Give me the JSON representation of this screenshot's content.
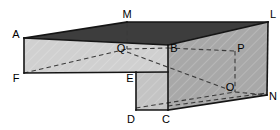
{
  "figure": {
    "name": "3d-solid-diagram",
    "width": 280,
    "height": 130,
    "background_color": "#ffffff"
  },
  "colors": {
    "top_face": "#3d3d3d",
    "left_front_face": "#d0d0d0",
    "right_front_face": "#a8a8a8",
    "step_front_face": "#c4c4c4",
    "step_side_face": "#b4b4b4",
    "outline": "#1a1a1a",
    "hidden_edge": "#444444",
    "label_text": "#000000"
  },
  "labels": [
    {
      "id": "A",
      "text": "A",
      "x": 16,
      "y": 34
    },
    {
      "id": "M",
      "text": "M",
      "x": 127,
      "y": 14
    },
    {
      "id": "L",
      "text": "L",
      "x": 273,
      "y": 14
    },
    {
      "id": "Q",
      "text": "Q",
      "x": 121,
      "y": 48
    },
    {
      "id": "B",
      "text": "B",
      "x": 174,
      "y": 48
    },
    {
      "id": "P",
      "text": "P",
      "x": 241,
      "y": 48
    },
    {
      "id": "F",
      "text": "F",
      "x": 16,
      "y": 78
    },
    {
      "id": "E",
      "text": "E",
      "x": 130,
      "y": 78
    },
    {
      "id": "O",
      "text": "O",
      "x": 230,
      "y": 87
    },
    {
      "id": "N",
      "text": "N",
      "x": 273,
      "y": 96
    },
    {
      "id": "D",
      "text": "D",
      "x": 131,
      "y": 119
    },
    {
      "id": "C",
      "text": "C",
      "x": 166,
      "y": 119
    }
  ],
  "vertices": {
    "A": {
      "x": 24,
      "y": 38
    },
    "M": {
      "x": 127,
      "y": 22
    },
    "L": {
      "x": 268,
      "y": 22
    },
    "B": {
      "x": 168,
      "y": 45
    },
    "Q": {
      "x": 127,
      "y": 49
    },
    "P": {
      "x": 235,
      "y": 51
    },
    "F": {
      "x": 24,
      "y": 73
    },
    "E": {
      "x": 136,
      "y": 72
    },
    "O": {
      "x": 235,
      "y": 92
    },
    "N": {
      "x": 267,
      "y": 95
    },
    "D": {
      "x": 136,
      "y": 110
    },
    "C": {
      "x": 168,
      "y": 110
    }
  },
  "faces": [
    {
      "name": "top-face",
      "vertices": "A,M,L,B",
      "fill": "#3d3d3d"
    },
    {
      "name": "left-front-face",
      "vertices": "A,B,E,F",
      "fill": "#d0d0d0"
    },
    {
      "name": "right-front-face",
      "vertices": "B,L,N,C",
      "fill": "#a8a8a8"
    },
    {
      "name": "step-front-face",
      "vertices": "E,C,D",
      "fill": "#c4c4c4"
    }
  ],
  "solid_edges": [
    {
      "name": "edge-A-M",
      "from": "A",
      "to": "M"
    },
    {
      "name": "edge-M-L",
      "from": "M",
      "to": "L"
    },
    {
      "name": "edge-L-B",
      "from": "L",
      "to": "B"
    },
    {
      "name": "edge-A-B",
      "from": "A",
      "to": "B"
    },
    {
      "name": "edge-A-F",
      "from": "A",
      "to": "F"
    },
    {
      "name": "edge-F-E",
      "from": "F",
      "to": "E"
    },
    {
      "name": "edge-E-D",
      "from": "E",
      "to": "D"
    },
    {
      "name": "edge-D-C",
      "from": "D",
      "to": "C"
    },
    {
      "name": "edge-B-C",
      "from": "B",
      "to": "C"
    },
    {
      "name": "edge-C-N",
      "from": "C",
      "to": "N"
    },
    {
      "name": "edge-L-N",
      "from": "L",
      "to": "N"
    }
  ],
  "hidden_edges": [
    {
      "name": "hidden-edge-M-Q",
      "from": "M",
      "to": "Q"
    },
    {
      "name": "hidden-edge-F-Q",
      "from": "F",
      "to": "Q"
    },
    {
      "name": "hidden-edge-Q-B",
      "from": "Q",
      "to": "B"
    },
    {
      "name": "hidden-edge-B-P",
      "from": "B",
      "to": "P"
    },
    {
      "name": "hidden-edge-P-O",
      "from": "P",
      "to": "O"
    },
    {
      "name": "hidden-edge-Q-O",
      "from": "Q",
      "to": "O"
    },
    {
      "name": "hidden-edge-D-O",
      "from": "D",
      "to": "O"
    },
    {
      "name": "hidden-edge-O-N",
      "from": "O",
      "to": "N"
    }
  ]
}
